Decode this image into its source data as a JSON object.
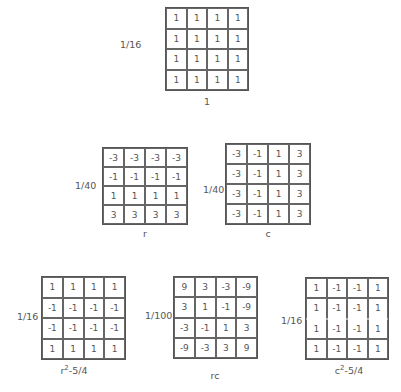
{
  "figure": {
    "matrices": [
      {
        "id": "constant",
        "scale": "1/16",
        "label": "1",
        "cells": [
          [
            "1",
            "1",
            "1",
            "1"
          ],
          [
            "1",
            "1",
            "1",
            "1"
          ],
          [
            "1",
            "1",
            "1",
            "1"
          ],
          [
            "1",
            "1",
            "1",
            "1"
          ]
        ]
      },
      {
        "id": "r",
        "scale": "1/40",
        "label": "r",
        "cells": [
          [
            "-3",
            "-3",
            "-3",
            "-3"
          ],
          [
            "-1",
            "-1",
            "-1",
            "-1"
          ],
          [
            "1",
            "1",
            "1",
            "1"
          ],
          [
            "3",
            "3",
            "3",
            "3"
          ]
        ]
      },
      {
        "id": "c",
        "scale": "1/40",
        "label": "c",
        "cells": [
          [
            "-3",
            "-1",
            "1",
            "3"
          ],
          [
            "-3",
            "-1",
            "1",
            "3"
          ],
          [
            "-3",
            "-1",
            "1",
            "3"
          ],
          [
            "-3",
            "-1",
            "1",
            "3"
          ]
        ]
      },
      {
        "id": "r2",
        "scale": "1/16",
        "label_base": "r",
        "label_sup": "2",
        "label_rest": "-5/4",
        "cells": [
          [
            "1",
            "1",
            "1",
            "1"
          ],
          [
            "-1",
            "-1",
            "-1",
            "-1"
          ],
          [
            "-1",
            "-1",
            "-1",
            "-1"
          ],
          [
            "1",
            "1",
            "1",
            "1"
          ]
        ]
      },
      {
        "id": "rc",
        "scale": "1/100",
        "label": "rc",
        "cells": [
          [
            "9",
            "3",
            "-3",
            "-9"
          ],
          [
            "3",
            "1",
            "-1",
            "-9"
          ],
          [
            "-3",
            "-1",
            "1",
            "3"
          ],
          [
            "-9",
            "-3",
            "3",
            "9"
          ]
        ]
      },
      {
        "id": "c2",
        "scale": "1/16",
        "label_base": "c",
        "label_sup": "2",
        "label_rest": "-5/4",
        "cells": [
          [
            "1",
            "-1",
            "-1",
            "1"
          ],
          [
            "1",
            "-1",
            "-1",
            "1"
          ],
          [
            "1",
            "-1",
            "-1",
            "1"
          ],
          [
            "1",
            "-1",
            "-1",
            "1"
          ]
        ]
      }
    ]
  }
}
